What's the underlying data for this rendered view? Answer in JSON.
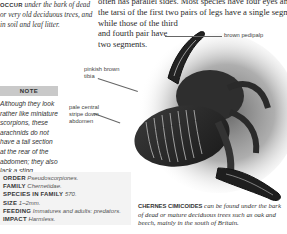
{
  "occur_text": {
    "lead": "OCCUR",
    "body": " under the bark of dead or very old deciduous trees, and in soil and leaf litter."
  },
  "body_text": {
    "lines": [
      "often has parallel sides. Most species have four eyes and",
      "the tarsi of the first two pairs of legs have a single segment,",
      "while those of the third",
      "and fourth pair have",
      "two segments."
    ]
  },
  "note": {
    "title": "NOTE",
    "body": "Although they look rather like miniature scorpions, these arachnids do not have a tail section at the rear of the abdomen; they also lack a sting."
  },
  "facts": [
    {
      "key": "ORDER",
      "value": "Pseudoscorpiones."
    },
    {
      "key": "FAMILY",
      "value": "Chernetidae."
    },
    {
      "key": "SPECIES IN FAMILY",
      "value": "570."
    },
    {
      "key": "SIZE",
      "value": "1–2mm."
    },
    {
      "key": "FEEDING",
      "value": "Immatures and adults: predators."
    },
    {
      "key": "IMPACT",
      "value": "Harmless."
    }
  ],
  "labels": {
    "pedipalp": "brown pedipalp",
    "tibia_1": "pinkish brown",
    "tibia_2": "tibia",
    "stripe_1": "pale central",
    "stripe_2": "stripe down",
    "stripe_3": "abdomen"
  },
  "caption": {
    "lead": "CHERNES CIMICOIDES",
    "body": " can be found under the bark of dead or mature deciduous trees such as oak and beech, mainly in the south of Britain."
  },
  "colors": {
    "note_header_bg": "#c9c9c9",
    "facts_bg": "#f3f3f3",
    "text": "#222222"
  }
}
